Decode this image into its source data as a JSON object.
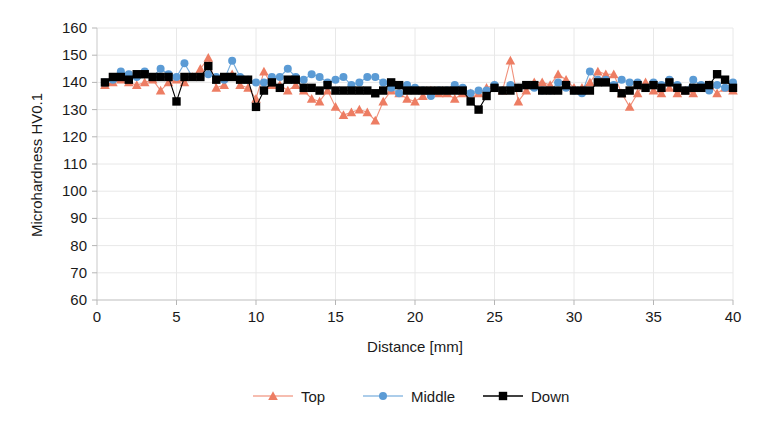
{
  "chart_data": {
    "type": "line",
    "title": "",
    "xlabel": "Distance [mm]",
    "ylabel": "Microhardness HV0.1",
    "xlim": [
      0,
      40
    ],
    "ylim": [
      60,
      160
    ],
    "xticks": [
      0,
      5,
      10,
      15,
      20,
      25,
      30,
      35,
      40
    ],
    "yticks": [
      60,
      70,
      80,
      90,
      100,
      110,
      120,
      130,
      140,
      150,
      160
    ],
    "xtick_labels": [
      "0",
      "5",
      "10",
      "15",
      "20",
      "25",
      "30",
      "35",
      "40"
    ],
    "ytick_labels": [
      "60",
      "70",
      "80",
      "90",
      "100",
      "110",
      "120",
      "130",
      "140",
      "150",
      "160"
    ],
    "grid": true,
    "grid_axis": "both",
    "legend_position": "bottom",
    "x": [
      0.5,
      1.0,
      1.5,
      2.0,
      2.5,
      3.0,
      3.5,
      4.0,
      4.5,
      5.0,
      5.5,
      6.0,
      6.5,
      7.0,
      7.5,
      8.0,
      8.5,
      9.0,
      9.5,
      10.0,
      10.5,
      11.0,
      11.5,
      12.0,
      12.5,
      13.0,
      13.5,
      14.0,
      14.5,
      15.0,
      15.5,
      16.0,
      16.5,
      17.0,
      17.5,
      18.0,
      18.5,
      19.0,
      19.5,
      20.0,
      20.5,
      21.0,
      21.5,
      22.0,
      22.5,
      23.0,
      23.5,
      24.0,
      24.5,
      25.0,
      25.5,
      26.0,
      26.5,
      27.0,
      27.5,
      28.0,
      28.5,
      29.0,
      29.5,
      30.0,
      30.5,
      31.0,
      31.5,
      32.0,
      32.5,
      33.0,
      33.5,
      34.0,
      34.5,
      35.0,
      35.5,
      36.0,
      36.5,
      37.0,
      37.5,
      38.0,
      38.5,
      39.0,
      39.5,
      40.0
    ],
    "series": [
      {
        "name": "Top",
        "color": "#ED7D63",
        "marker": "triangle",
        "values": [
          139,
          140,
          141,
          140,
          139,
          140,
          141,
          137,
          140,
          141,
          140,
          142,
          145,
          149,
          138,
          139,
          143,
          139,
          138,
          134,
          144,
          139,
          139,
          137,
          139,
          137,
          134,
          133,
          137,
          131,
          128,
          129,
          130,
          129,
          126,
          133,
          137,
          136,
          134,
          133,
          135,
          137,
          136,
          136,
          134,
          136,
          136,
          136,
          138,
          139,
          137,
          148,
          133,
          137,
          140,
          140,
          139,
          143,
          141,
          138,
          138,
          140,
          144,
          143,
          143,
          136,
          131,
          136,
          140,
          137,
          136,
          138,
          136,
          137,
          136,
          138,
          139,
          136,
          138,
          137
        ]
      },
      {
        "name": "Middle",
        "color": "#5B9BD5",
        "marker": "circle",
        "values": [
          140,
          141,
          144,
          143,
          142,
          144,
          142,
          145,
          143,
          142,
          147,
          142,
          142,
          143,
          142,
          141,
          148,
          142,
          141,
          140,
          140,
          142,
          142,
          145,
          142,
          141,
          143,
          142,
          140,
          141,
          142,
          139,
          140,
          142,
          142,
          140,
          138,
          136,
          139,
          138,
          137,
          135,
          137,
          137,
          139,
          138,
          136,
          137,
          137,
          139,
          137,
          139,
          138,
          139,
          138,
          137,
          137,
          140,
          138,
          137,
          136,
          144,
          141,
          141,
          139,
          141,
          140,
          140,
          138,
          140,
          139,
          141,
          139,
          137,
          141,
          139,
          137,
          139,
          138,
          140
        ]
      },
      {
        "name": "Down",
        "color": "#000000",
        "marker": "square",
        "values": [
          140,
          142,
          142,
          141,
          143,
          143,
          142,
          142,
          142,
          133,
          142,
          142,
          142,
          146,
          141,
          142,
          142,
          141,
          141,
          131,
          137,
          140,
          138,
          141,
          141,
          138,
          138,
          137,
          139,
          137,
          137,
          137,
          137,
          137,
          136,
          137,
          140,
          139,
          137,
          137,
          137,
          137,
          137,
          137,
          137,
          137,
          133,
          130,
          135,
          138,
          137,
          137,
          138,
          139,
          139,
          137,
          137,
          137,
          139,
          137,
          137,
          137,
          140,
          140,
          138,
          136,
          137,
          139,
          138,
          139,
          138,
          140,
          138,
          137,
          138,
          138,
          139,
          143,
          141,
          138
        ]
      }
    ]
  },
  "legend": {
    "items": [
      {
        "label": "Top",
        "color": "#ED7D63",
        "marker": "triangle"
      },
      {
        "label": "Middle",
        "color": "#5B9BD5",
        "marker": "circle"
      },
      {
        "label": "Down",
        "color": "#000000",
        "marker": "square"
      }
    ]
  }
}
